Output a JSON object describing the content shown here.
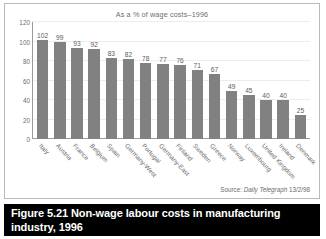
{
  "chart_data": {
    "type": "bar",
    "title": "As a % of wage costs–1996",
    "xlabel": "",
    "ylabel": "",
    "ylim": [
      0,
      120
    ],
    "yticks": [
      0,
      20,
      40,
      60,
      80,
      100,
      120
    ],
    "grid": true,
    "legend": "none",
    "bar_color": "#818181",
    "categories": [
      "Italy",
      "Austria",
      "France",
      "Belgium",
      "Spain",
      "Germany-West",
      "Portugal",
      "Germany-East",
      "Finland",
      "Sweden",
      "Greece",
      "Norway",
      "Luxembourg",
      "United Kingdom",
      "Ireland",
      "Denmark"
    ],
    "values": [
      102,
      99,
      93,
      92,
      83,
      82,
      78,
      77,
      76,
      71,
      67,
      49,
      45,
      40,
      40,
      25
    ],
    "source_prefix": "Source:",
    "source_publication": "Daily Telegraph",
    "source_date": "13/2/98"
  },
  "caption": {
    "figure_number": "Figure 5.21",
    "text": "Non-wage labour costs in manufacturing industry, 1996"
  }
}
